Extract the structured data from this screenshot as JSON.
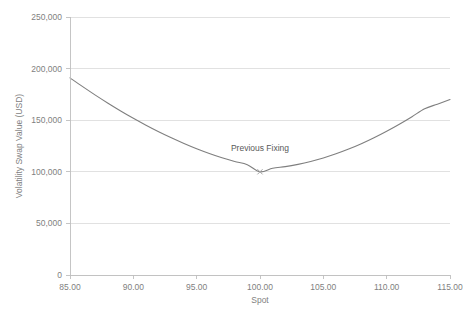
{
  "chart_data": {
    "type": "line",
    "title": "",
    "xlabel": "Spot",
    "ylabel": "Volatility Swap Value (USD)",
    "xlim": [
      85,
      115
    ],
    "ylim": [
      0,
      250000
    ],
    "grid": "horizontal",
    "legend": "none",
    "x_tick_labels": [
      "85.00",
      "90.00",
      "95.00",
      "100.00",
      "105.00",
      "110.00",
      "115.00"
    ],
    "x_ticks": [
      85,
      90,
      95,
      100,
      105,
      110,
      115
    ],
    "y_tick_labels": [
      "0",
      "50,000",
      "100,000",
      "150,000",
      "200,000",
      "250,000"
    ],
    "y_ticks": [
      0,
      50000,
      100000,
      150000,
      200000,
      250000
    ],
    "series": [
      {
        "name": "Volatility Swap Value",
        "color": "#7f7f7f",
        "x": [
          85,
          86,
          87,
          88,
          89,
          90,
          91,
          92,
          93,
          94,
          95,
          96,
          97,
          98,
          99,
          100,
          101,
          102,
          103,
          104,
          105,
          106,
          107,
          108,
          109,
          110,
          111,
          112,
          113,
          114,
          115
        ],
        "values": [
          191000,
          182500,
          174300,
          166500,
          159000,
          151900,
          145200,
          138900,
          133000,
          127500,
          122400,
          117800,
          113600,
          110000,
          106900,
          100000,
          103500,
          105000,
          107200,
          110000,
          113400,
          117400,
          122000,
          127200,
          133000,
          139300,
          146100,
          153400,
          161100,
          165500,
          170000
        ]
      }
    ],
    "annotations": [
      {
        "text": "Previous Fixing",
        "x": 100,
        "y": 100000,
        "marker": "x-marker",
        "marker_color": "#a6a6a6",
        "label_offset_y": 20000
      }
    ]
  },
  "axis": {
    "x_title": "Spot",
    "y_title": "Volatility Swap Value (USD)"
  },
  "colors": {
    "series": "#7f7f7f",
    "gridline": "#d9d9d9",
    "axis": "#bfbfbf",
    "tick_text": "#7f7f7f",
    "annotation_text": "#595959",
    "background": "#ffffff"
  }
}
